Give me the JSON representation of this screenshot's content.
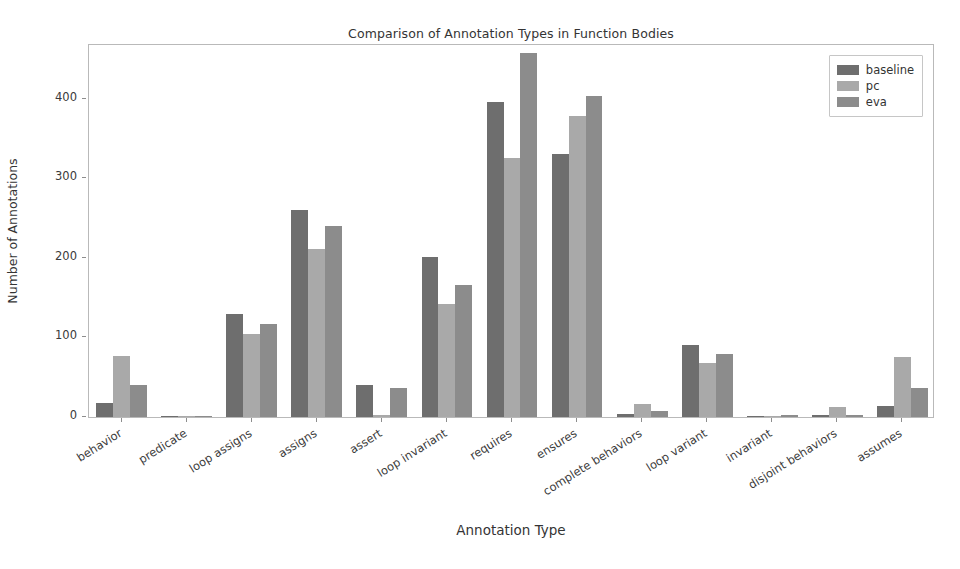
{
  "chart_data": {
    "type": "bar",
    "title": "Comparison of Annotation Types in Function Bodies",
    "xlabel": "Annotation Type",
    "ylabel": "Number of Annotations",
    "ylim": [
      0,
      470
    ],
    "yticks": [
      0,
      100,
      200,
      300,
      400
    ],
    "grid": false,
    "legend_position": "upper right",
    "categories": [
      "behavior",
      "predicate",
      "loop assigns",
      "assigns",
      "assert",
      "loop invariant",
      "requires",
      "ensures",
      "complete behaviors",
      "loop variant",
      "invariant",
      "disjoint behaviors",
      "assumes"
    ],
    "series": [
      {
        "name": "baseline",
        "color": "#6e6e6e",
        "values": [
          18,
          1,
          130,
          260,
          40,
          201,
          396,
          330,
          4,
          91,
          1,
          2,
          14
        ]
      },
      {
        "name": "pc",
        "color": "#a9a9a9",
        "values": [
          77,
          1,
          104,
          211,
          2,
          142,
          325,
          378,
          16,
          68,
          1,
          13,
          76
        ]
      },
      {
        "name": "eva",
        "color": "#8c8c8c",
        "values": [
          40,
          1,
          117,
          240,
          36,
          166,
          458,
          403,
          7,
          79,
          2,
          3,
          37
        ]
      }
    ]
  }
}
